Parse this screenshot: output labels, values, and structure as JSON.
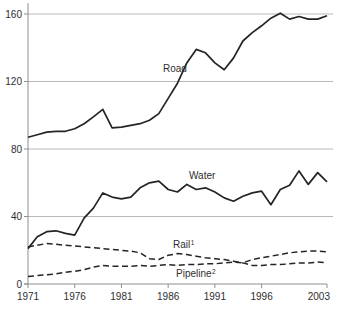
{
  "chart_data": {
    "type": "line",
    "x": [
      1971,
      1972,
      1973,
      1974,
      1975,
      1976,
      1977,
      1978,
      1979,
      1980,
      1981,
      1982,
      1983,
      1984,
      1985,
      1986,
      1987,
      1988,
      1989,
      1990,
      1991,
      1992,
      1993,
      1994,
      1995,
      1996,
      1997,
      1998,
      1999,
      2000,
      2001,
      2002,
      2003
    ],
    "series": [
      {
        "name": "Road",
        "label": "Road",
        "superscript": "",
        "style": "solid",
        "values": [
          87,
          88.5,
          90,
          90.5,
          90.5,
          92,
          95,
          99,
          103.5,
          92.5,
          93,
          94,
          95,
          97,
          101,
          110,
          119,
          131,
          139,
          137,
          131,
          127,
          134,
          144,
          149,
          153,
          157.5,
          160.5,
          157,
          158.5,
          157,
          157,
          159
        ],
        "label_x": 163,
        "label_y": 72
      },
      {
        "name": "Water",
        "label": "Water",
        "superscript": "",
        "style": "solid",
        "values": [
          21,
          28,
          31,
          31.5,
          30,
          29,
          39,
          45,
          54,
          51.5,
          50.5,
          51.5,
          57,
          60,
          61,
          56,
          54.5,
          59,
          56,
          57,
          54.5,
          51,
          49,
          52,
          54,
          55,
          47,
          56,
          58.5,
          67,
          59,
          66,
          60.5
        ],
        "label_x": 189,
        "label_y": 179
      },
      {
        "name": "Rail",
        "label": "Rail",
        "superscript": "1",
        "style": "dashed",
        "values": [
          22,
          23,
          24,
          23.5,
          23,
          22.5,
          22,
          21.5,
          21,
          20.5,
          20,
          19.5,
          18.5,
          15,
          14.5,
          17,
          18,
          17.5,
          16.5,
          15.5,
          15,
          14.5,
          13.5,
          12.5,
          11,
          11,
          11.5,
          11.5,
          12,
          12.5,
          12.5,
          13,
          12.5
        ],
        "label_x": 173,
        "label_y": 248
      },
      {
        "name": "Pipeline",
        "label": "Pipeline",
        "superscript": "2",
        "style": "dashed",
        "values": [
          4.5,
          5,
          5.5,
          6,
          7,
          7.5,
          8.5,
          10,
          11,
          10.5,
          10.5,
          10.5,
          11,
          10.5,
          11,
          11.5,
          11,
          11.5,
          11.5,
          12,
          12,
          12.5,
          13,
          12.5,
          14.5,
          15.5,
          16.5,
          17.5,
          18.5,
          19,
          19.5,
          19.5,
          19
        ],
        "label_x": 176,
        "label_y": 277
      }
    ],
    "title": "",
    "xlabel": "",
    "ylabel": "",
    "ylim": [
      0,
      160
    ],
    "yticks": [
      0,
      40,
      80,
      120,
      160
    ],
    "xticks": [
      1971,
      1976,
      1981,
      1986,
      1991,
      1996,
      2003
    ],
    "grid": "horizontal",
    "legend": "inline-labels",
    "colors": {
      "line": "#242424",
      "grid": "#b8b8b8",
      "axis": "#8f8f8f",
      "text": "#2e2e2e"
    }
  }
}
